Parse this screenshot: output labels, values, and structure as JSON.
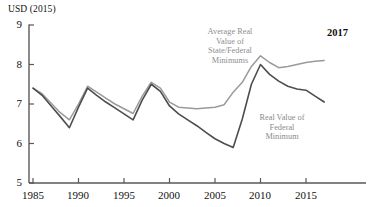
{
  "chart_data": {
    "type": "line",
    "title": "",
    "subtitle": "",
    "ylabel": "USD (2015)",
    "xlabel": "",
    "xlim": [
      1985,
      2017
    ],
    "ylim": [
      5,
      9
    ],
    "yticks": [
      "9",
      "8",
      "7",
      "6",
      "5"
    ],
    "ytick_values": [
      9,
      8,
      7,
      6,
      5
    ],
    "xticks": [
      "1985",
      "1990",
      "1995",
      "2000",
      "2005",
      "2010",
      "2015"
    ],
    "xtick_values": [
      1985,
      1990,
      1995,
      2000,
      2005,
      2010,
      2015
    ],
    "grid": false,
    "legend_position": "inline-annotations",
    "end_label": "2017",
    "x": [
      1985,
      1986,
      1987,
      1988,
      1989,
      1990,
      1991,
      1992,
      1993,
      1994,
      1995,
      1996,
      1997,
      1998,
      1999,
      2000,
      2001,
      2002,
      2003,
      2004,
      2005,
      2006,
      2007,
      2008,
      2009,
      2010,
      2011,
      2012,
      2013,
      2014,
      2015,
      2016,
      2017
    ],
    "series": [
      {
        "name": "Average Real Value of State/Federal Minimums",
        "color": "#9a9a9a",
        "values": [
          7.4,
          7.26,
          7.02,
          6.78,
          6.6,
          7.0,
          7.45,
          7.3,
          7.15,
          7.0,
          6.88,
          6.76,
          7.2,
          7.55,
          7.4,
          7.05,
          6.92,
          6.9,
          6.88,
          6.9,
          6.92,
          6.98,
          7.3,
          7.55,
          7.95,
          8.22,
          8.05,
          7.92,
          7.95,
          8.0,
          8.05,
          8.08,
          8.1
        ]
      },
      {
        "name": "Real Value of Federal Minimum",
        "color": "#4d4d4d",
        "values": [
          7.4,
          7.22,
          6.95,
          6.68,
          6.4,
          6.92,
          7.4,
          7.22,
          7.05,
          6.9,
          6.75,
          6.6,
          7.1,
          7.5,
          7.32,
          6.95,
          6.75,
          6.6,
          6.45,
          6.28,
          6.12,
          6.0,
          5.9,
          6.62,
          7.5,
          8.0,
          7.75,
          7.58,
          7.45,
          7.38,
          7.35,
          7.2,
          7.05
        ]
      }
    ],
    "annotations": [
      {
        "name": "average-state-federal-annotation",
        "text": "Average Real\nValue of\nState/Federal\nMinimums",
        "line1": "Average Real",
        "line2": "Value of",
        "line3": "State/Federal",
        "line4": "Minimums"
      },
      {
        "name": "federal-minimum-annotation",
        "text": "Real Value of\nFederal\nMinimum",
        "line1": "Real Value of",
        "line2": "Federal",
        "line3": "Minimum"
      }
    ]
  }
}
